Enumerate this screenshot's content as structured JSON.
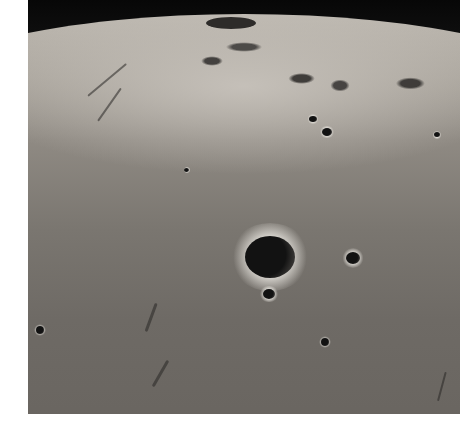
{
  "image": {
    "subject": "Oblique view of lunar surface with a prominent bright-rimmed impact crater",
    "colors": {
      "space": "#0c0c0c",
      "highlands": "#bdb8b0",
      "mare": "#6e6a65",
      "crater_floor": "#121212",
      "margin": "#ffffff"
    },
    "craters": [
      {
        "name": "main-crater",
        "x": 245,
        "y": 236,
        "w": 50,
        "h": 42
      },
      {
        "name": "small-crater-1",
        "x": 263,
        "y": 289,
        "w": 12,
        "h": 10
      },
      {
        "name": "small-crater-2",
        "x": 346,
        "y": 252,
        "w": 14,
        "h": 12
      },
      {
        "name": "small-crater-3",
        "x": 322,
        "y": 128,
        "w": 10,
        "h": 8
      },
      {
        "name": "small-crater-4",
        "x": 309,
        "y": 116,
        "w": 8,
        "h": 6
      },
      {
        "name": "small-crater-5",
        "x": 321,
        "y": 338,
        "w": 8,
        "h": 8
      },
      {
        "name": "small-crater-6",
        "x": 36,
        "y": 326,
        "w": 8,
        "h": 8
      },
      {
        "name": "small-crater-7",
        "x": 434,
        "y": 132,
        "w": 6,
        "h": 5
      },
      {
        "name": "small-crater-8",
        "x": 184,
        "y": 168,
        "w": 5,
        "h": 4
      }
    ]
  }
}
